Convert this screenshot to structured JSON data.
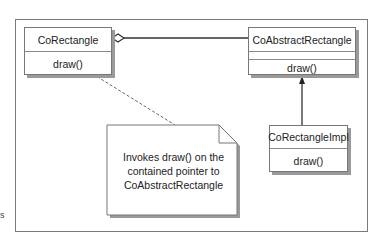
{
  "diagram": {
    "type": "UML class diagram",
    "classes": [
      {
        "name": "CoRectangle",
        "operations": [
          "draw()"
        ]
      },
      {
        "name": "CoAbstractRectangle",
        "attributes": [],
        "operations": [
          "draw()"
        ]
      },
      {
        "name": "CoRectangleImpl",
        "operations": [
          "draw()"
        ]
      }
    ],
    "relations": [
      {
        "from": "CoRectangle",
        "to": "CoAbstractRectangle",
        "kind": "aggregation"
      },
      {
        "from": "CoRectangleImpl",
        "to": "CoAbstractRectangle",
        "kind": "inheritance"
      }
    ],
    "note": {
      "lines": [
        "Invokes draw() on the",
        "contained pointer to",
        "CoAbstractRectangle"
      ],
      "attached_to": "CoRectangle.draw()"
    },
    "side_text": "s"
  }
}
